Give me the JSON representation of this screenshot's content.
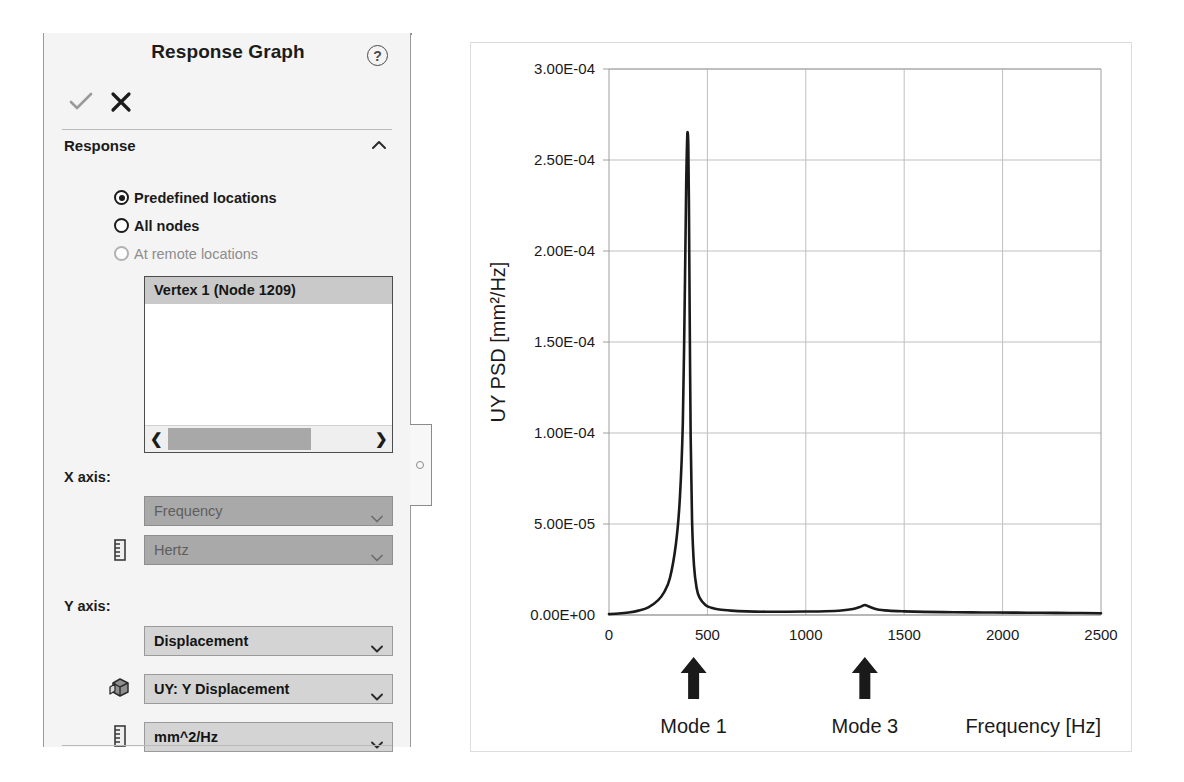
{
  "panel": {
    "title": "Response Graph",
    "help_icon": "help-circle-icon",
    "accept_icon": "check-icon",
    "cancel_icon": "close-icon",
    "section": {
      "header": "Response",
      "collapse_icon": "chevron-up-icon"
    },
    "radios": [
      {
        "label": "Predefined locations",
        "selected": true,
        "enabled": true
      },
      {
        "label": "All nodes",
        "selected": false,
        "enabled": true
      },
      {
        "label": "At remote locations",
        "selected": false,
        "enabled": false
      }
    ],
    "list": {
      "items": [
        "Vertex 1 (Node 1209)"
      ],
      "scroll_left_icon": "chevron-left-icon",
      "scroll_right_icon": "chevron-right-icon"
    },
    "x_axis": {
      "label": "X axis:",
      "quantity": "Frequency",
      "unit": "Hertz",
      "unit_icon": "ruler-icon",
      "enabled": false
    },
    "y_axis": {
      "label": "Y axis:",
      "quantity": "Displacement",
      "component": "UY: Y Displacement",
      "component_icon": "solid-body-icon",
      "unit": "mm^2/Hz",
      "unit_icon": "ruler-icon",
      "enabled": true
    },
    "colors": {
      "panel_bg": "#f4f4f4",
      "combo_enabled_bg": "#d4d4d4",
      "combo_disabled_bg": "#a9a9a9",
      "list_selection_bg": "#c9c9c9",
      "scrollbar_thumb": "#a8a8a8"
    }
  },
  "chart_data": {
    "type": "line",
    "title": "",
    "xlabel": "Frequency [Hz]",
    "ylabel": "UY PSD [mm²/Hz]",
    "xlim": [
      0,
      2500
    ],
    "ylim": [
      0,
      0.0003
    ],
    "xticks": [
      0,
      500,
      1000,
      1500,
      2000,
      2500
    ],
    "xticklabels": [
      "0",
      "500",
      "1000",
      "1500",
      "2000",
      "2500"
    ],
    "yticks": [
      0,
      5e-05,
      0.0001,
      0.00015,
      0.0002,
      0.00025,
      0.0003
    ],
    "yticklabels": [
      "0.00E+00",
      "5.00E-05",
      "1.00E-04",
      "1.50E-04",
      "2.00E-04",
      "2.50E-04",
      "3.00E-04"
    ],
    "grid": true,
    "legend": false,
    "line_color": "#1a1a1a",
    "series": [
      {
        "name": "UY PSD",
        "x": [
          0,
          50,
          100,
          150,
          200,
          250,
          280,
          310,
          340,
          360,
          375,
          385,
          392,
          397,
          400,
          403,
          406,
          410,
          415,
          422,
          432,
          445,
          460,
          490,
          520,
          560,
          620,
          700,
          800,
          900,
          1000,
          1100,
          1180,
          1240,
          1280,
          1300,
          1320,
          1360,
          1420,
          1500,
          1600,
          1750,
          1900,
          2050,
          2200,
          2350,
          2500
        ],
        "y": [
          5e-07,
          8e-07,
          1.4e-06,
          2.4e-06,
          4.2e-06,
          8.2e-06,
          1.25e-05,
          2.05e-05,
          3.9e-05,
          6.4e-05,
          0.000105,
          0.000175,
          0.000235,
          0.000261,
          0.000265,
          0.000258,
          0.000228,
          0.000165,
          9.8e-05,
          5.2e-05,
          2.7e-05,
          1.5e-05,
          9.5e-06,
          5.5e-06,
          4e-06,
          3e-06,
          2.4e-06,
          2e-06,
          1.8e-06,
          1.8e-06,
          1.9e-06,
          2.1e-06,
          2.5e-06,
          3.3e-06,
          4.6e-06,
          5.5e-06,
          4.7e-06,
          3.2e-06,
          2.4e-06,
          2e-06,
          1.7e-06,
          1.5e-06,
          1.4e-06,
          1.3e-06,
          1.2e-06,
          1.1e-06,
          1e-06
        ]
      }
    ],
    "annotations": [
      {
        "label": "Mode 1",
        "x": 430,
        "arrow_icon": "up-arrow-icon"
      },
      {
        "label": "Mode 3",
        "x": 1300,
        "arrow_icon": "up-arrow-icon"
      }
    ],
    "peaks": [
      {
        "name": "Mode 1",
        "frequency": 400,
        "value": 0.000265
      },
      {
        "name": "Mode 3",
        "frequency": 1300,
        "value": 5.5e-06
      }
    ]
  }
}
